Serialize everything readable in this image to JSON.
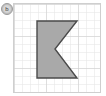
{
  "badge": {
    "label": "b",
    "icon": "circle-badge-icon"
  },
  "panel": {
    "title": "grid-paper-figure",
    "background_color": "#ffffff",
    "border_color": "#cfcfcf",
    "grid": {
      "minor_line_color": "#e2e2e2",
      "major_line_color": "#cccccc",
      "cell_size_px": 8,
      "major_every": 4,
      "columns": 11,
      "rows": 11
    },
    "shape": {
      "name": "left-pointing-chevron",
      "fill_color": "#a9a9a9",
      "stroke_color": "#4a4a4a",
      "stroke_width": 1.4,
      "points": "23,17 63,17 41,45 63,74 23,74",
      "vertices": [
        {
          "x": 23,
          "y": 17
        },
        {
          "x": 63,
          "y": 17
        },
        {
          "x": 41,
          "y": 45
        },
        {
          "x": 63,
          "y": 74
        },
        {
          "x": 23,
          "y": 74
        }
      ]
    }
  }
}
